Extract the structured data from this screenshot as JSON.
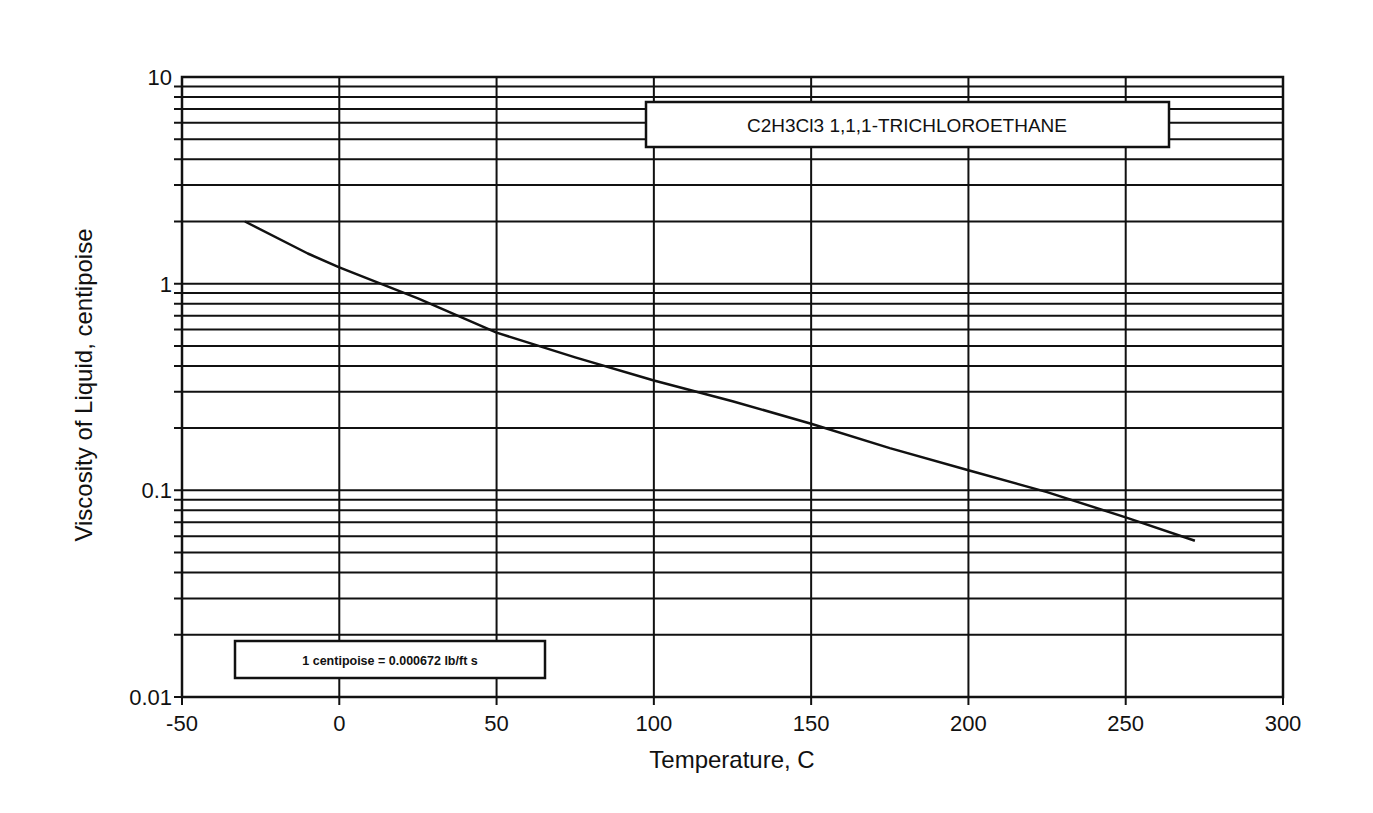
{
  "chart_data": {
    "type": "line",
    "title": "C2H3Cl3  1,1,1-TRICHLOROETHANE",
    "xlabel": "Temperature, C",
    "ylabel": "Viscosity of Liquid, centipoise",
    "x_scale": "linear",
    "y_scale": "log",
    "xlim": [
      -50,
      300
    ],
    "ylim": [
      0.01,
      10
    ],
    "x_ticks": [
      -50,
      0,
      50,
      100,
      150,
      200,
      250,
      300
    ],
    "x_tick_labels": [
      "-50",
      "0",
      "50",
      "100",
      "150",
      "200",
      "250",
      "300"
    ],
    "y_ticks": [
      0.01,
      0.1,
      1,
      10
    ],
    "y_tick_labels": [
      "0.01",
      "0.1",
      "1",
      "10"
    ],
    "grid": true,
    "annotation": "1 centipoise = 0.000672 lb/ft s",
    "series": [
      {
        "name": "1,1,1-Trichloroethane liquid viscosity",
        "x": [
          -30,
          -10,
          0,
          25,
          50,
          75,
          100,
          125,
          150,
          175,
          200,
          225,
          250,
          272
        ],
        "values": [
          2.0,
          1.4,
          1.2,
          0.85,
          0.58,
          0.44,
          0.34,
          0.27,
          0.21,
          0.16,
          0.125,
          0.098,
          0.074,
          0.057
        ]
      }
    ]
  },
  "legend_box": {
    "label": "C2H3Cl3  1,1,1-TRICHLOROETHANE"
  },
  "note_box": {
    "label": "1 centipoise = 0.000672 lb/ft s"
  },
  "colors": {
    "ink": "#111111",
    "background": "#ffffff"
  }
}
